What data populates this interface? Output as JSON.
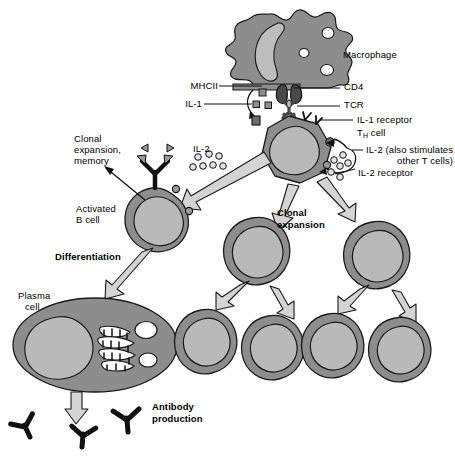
{
  "figure": {
    "background": "#ffffff"
  },
  "palette": {
    "cytoplasm": "#8d8d8d",
    "nucleus": "#b9b9b9",
    "macrophage_body": "#8d8d8d",
    "macrophage_nucleus": "#bdbdbd",
    "vacuole": "#ffffff",
    "arrow_fill": "#d4d4d4",
    "outline": "#1a1a1a",
    "antibody": "#111111",
    "antigen": "#9a9a9a",
    "text": "#000000"
  },
  "labels": {
    "macrophage": "Macrophage",
    "mhcii": "MHCII",
    "cd4": "CD4",
    "il1": "IL-1",
    "tcr": "TCR",
    "il1_receptor": "IL-1 receptor",
    "th_cell_pre": "T",
    "th_cell_sub": "H",
    "th_cell_post": " cell",
    "il2_left": "IL-2",
    "il2_stimulates_line1": "IL-2 (also stimulates",
    "il2_stimulates_line2": "other T cells)",
    "il2_receptor": "IL-2 receptor",
    "clonal_expansion_memory_line1": "Clonal",
    "clonal_expansion_memory_line2": "expansion,",
    "clonal_expansion_memory_line3": "memory",
    "activated_b_cell_line1": "Activated",
    "activated_b_cell_line2": "B cell",
    "clonal_expansion_line1": "Clonal",
    "clonal_expansion_line2": "expansion",
    "differentiation": "Differentiation",
    "plasma_cell_line1": "Plasma",
    "plasma_cell_line2": "cell",
    "antibody_production_line1": "Antibody",
    "antibody_production_line2": "production"
  },
  "icons": {
    "macrophage": "macrophage-cell-icon",
    "th_cell": "t-helper-cell-icon",
    "b_cell": "activated-b-cell-icon",
    "plasma_cell": "plasma-cell-icon",
    "daughter_cell": "daughter-cell-icon",
    "antibody": "antibody-y-icon",
    "antigen": "antigen-triangle-icon",
    "il1_molecule": "il1-square-icon",
    "il2_molecule": "il2-circle-icon",
    "receptor": "receptor-icon",
    "block_arrow": "block-arrow-icon",
    "leader_line": "leader-line-icon"
  },
  "counts": {
    "il1_squares": 3,
    "il2_circles_left": 7,
    "il2_circles_right": 6,
    "daughter_cells_row1": 2,
    "daughter_cells_row2": 4,
    "antibodies_secreted": 3,
    "antigen_triangles": 2,
    "macrophage_vacuoles": 3,
    "plasma_cell_vacuoles": 2,
    "b_cell_receptors": 2,
    "th_cell_il2_receptors": 2
  }
}
